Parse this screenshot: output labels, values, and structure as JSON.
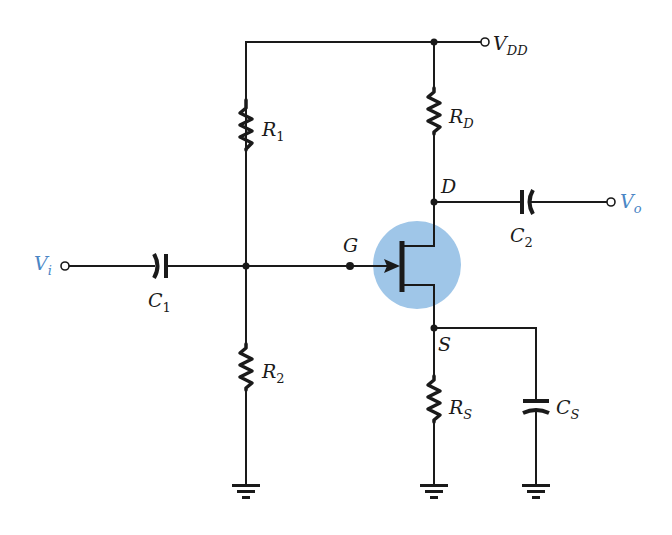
{
  "diagram": {
    "colors": {
      "wire": "#1a1a1a",
      "io_label": "#4a86c5",
      "transistor_highlight": "#9fc6e8"
    },
    "supply": {
      "label": "V",
      "sub": "DD"
    },
    "input": {
      "label": "V",
      "sub": "i"
    },
    "output": {
      "label": "V",
      "sub": "o"
    },
    "components": {
      "R1": {
        "label": "R",
        "sub": "1"
      },
      "R2": {
        "label": "R",
        "sub": "2"
      },
      "RD": {
        "label": "R",
        "sub": "D"
      },
      "RS": {
        "label": "R",
        "sub": "S"
      },
      "C1": {
        "label": "C",
        "sub": "1"
      },
      "C2": {
        "label": "C",
        "sub": "2"
      },
      "CS": {
        "label": "C",
        "sub": "S"
      }
    },
    "terminals": {
      "gate": "G",
      "drain": "D",
      "source": "S"
    }
  }
}
